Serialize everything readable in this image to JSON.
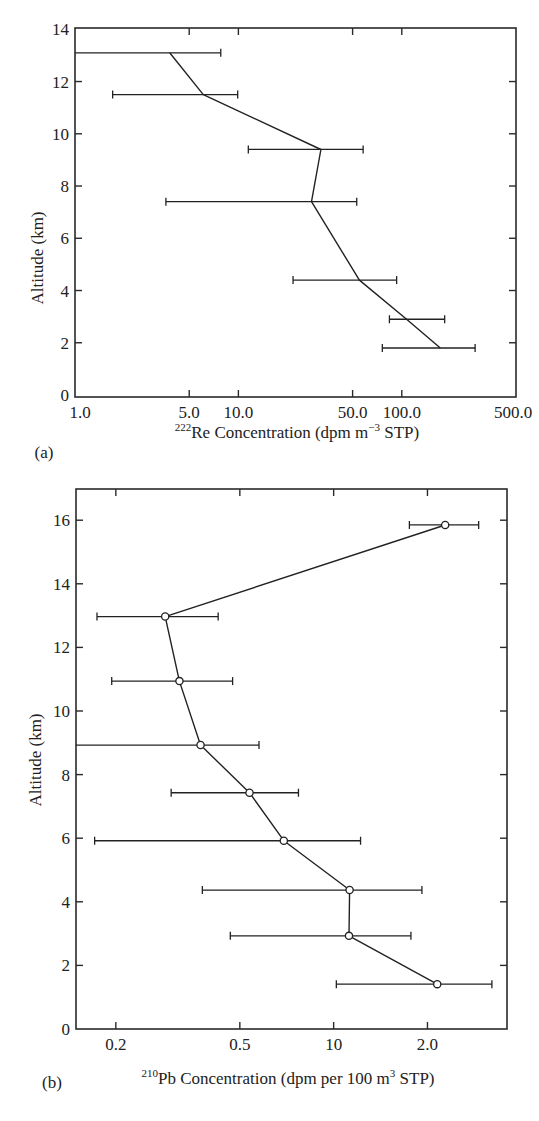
{
  "figure": {
    "panels": [
      {
        "panel_label": "(a)",
        "xlabel_sup": "222",
        "xlabel_main": "Re Concentration (dpm m",
        "xlabel_sup2": "−3",
        "xlabel_tail": " STP)",
        "ylabel": "Altitude (km)"
      },
      {
        "panel_label": "(b)",
        "xlabel_sup": "210",
        "xlabel_main": "Pb Concentration (dpm per 100 m",
        "xlabel_sup2": "3",
        "xlabel_tail": " STP)",
        "ylabel": "Altitude (km)"
      }
    ]
  },
  "chart_data": [
    {
      "type": "line",
      "title": "",
      "panel": "(a)",
      "xlabel": "222Re Concentration (dpm m^-3 STP)",
      "ylabel": "Altitude (km)",
      "xscale": "log",
      "xlim": [
        1.0,
        500.0
      ],
      "ylim": [
        0,
        14
      ],
      "x_ticks": [
        1.0,
        5.0,
        10.0,
        50.0,
        100.0,
        500.0
      ],
      "x_tick_labels": [
        "1.0",
        "5.0",
        "10.0",
        "50.0",
        "100.0",
        "500.0"
      ],
      "y_ticks": [
        0,
        2,
        4,
        6,
        8,
        10,
        12,
        14
      ],
      "y_tick_labels": [
        "0",
        "2",
        "4",
        "6",
        "8",
        "10",
        "12",
        "14"
      ],
      "markers": false,
      "grid": false,
      "series": [
        {
          "name": "222Re profile",
          "points": [
            {
              "altitude": 13.1,
              "value": 3.8,
              "err_low": 1.0,
              "err_high": 7.8
            },
            {
              "altitude": 11.5,
              "value": 6.1,
              "err_low": 1.7,
              "err_high": 9.9
            },
            {
              "altitude": 9.4,
              "value": 32,
              "err_low": 11.5,
              "err_high": 58
            },
            {
              "altitude": 7.4,
              "value": 28,
              "err_low": 3.6,
              "err_high": 53
            },
            {
              "altitude": 4.4,
              "value": 55,
              "err_low": 21.6,
              "err_high": 93
            },
            {
              "altitude": 2.9,
              "value": 107,
              "err_low": null,
              "err_high": 183,
              "err_low_bar": 84
            },
            {
              "altitude": 1.8,
              "value": 172,
              "err_low": 76,
              "err_high": 281
            }
          ]
        }
      ]
    },
    {
      "type": "line",
      "title": "",
      "panel": "(b)",
      "xlabel": "210Pb Concentration (dpm per 100 m^3 STP)",
      "ylabel": "Altitude (km)",
      "xscale": "log",
      "xlim": [
        0.149,
        3.6
      ],
      "ylim": [
        0,
        17
      ],
      "x_ticks": [
        0.2,
        0.5,
        1.0,
        2.0
      ],
      "x_tick_labels": [
        "0.2",
        "0.5",
        "10",
        "2.0"
      ],
      "y_ticks": [
        0,
        2,
        4,
        6,
        8,
        10,
        12,
        14,
        16
      ],
      "y_tick_labels": [
        "0",
        "2",
        "4",
        "6",
        "8",
        "10",
        "12",
        "14",
        "16"
      ],
      "markers": true,
      "marker_style": "open circle",
      "grid": false,
      "series": [
        {
          "name": "210Pb profile",
          "points": [
            {
              "altitude": 15.85,
              "value": 2.28,
              "err_low": 1.75,
              "err_high": 2.92
            },
            {
              "altitude": 12.97,
              "value": 0.288,
              "err_low": 0.174,
              "err_high": 0.426
            },
            {
              "altitude": 10.94,
              "value": 0.32,
              "err_low": 0.194,
              "err_high": 0.474
            },
            {
              "altitude": 8.93,
              "value": 0.374,
              "err_low": 0.149,
              "err_high": 0.576
            },
            {
              "altitude": 7.43,
              "value": 0.537,
              "err_low": 0.301,
              "err_high": 0.771
            },
            {
              "altitude": 5.92,
              "value": 0.692,
              "err_low": 0.171,
              "err_high": 1.22
            },
            {
              "altitude": 4.37,
              "value": 1.125,
              "err_low": 0.379,
              "err_high": 1.92
            },
            {
              "altitude": 2.93,
              "value": 1.12,
              "err_low": 0.466,
              "err_high": 1.77
            },
            {
              "altitude": 1.41,
              "value": 2.15,
              "err_low": 1.02,
              "err_high": 3.22
            }
          ]
        }
      ]
    }
  ]
}
